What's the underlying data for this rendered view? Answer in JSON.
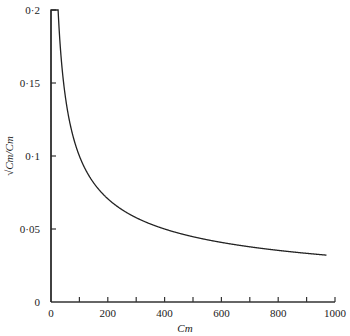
{
  "chart_data": {
    "type": "line",
    "title": "",
    "xlabel": "Cm",
    "ylabel": "√Cm/Cm",
    "xlim": [
      0,
      1000
    ],
    "ylim": [
      0,
      0.2
    ],
    "x_ticks": [
      0,
      100,
      200,
      300,
      400,
      500,
      600,
      700,
      800,
      900,
      1000
    ],
    "x_tick_labels": [
      {
        "value": 0,
        "label": "0"
      },
      {
        "value": 200,
        "label": "200"
      },
      {
        "value": 400,
        "label": "400"
      },
      {
        "value": 600,
        "label": "600"
      },
      {
        "value": 800,
        "label": "800"
      },
      {
        "value": 1000,
        "label": "1000"
      }
    ],
    "y_tick_labels": [
      {
        "value": 0,
        "label": "0"
      },
      {
        "value": 0.05,
        "label": "0·05"
      },
      {
        "value": 0.1,
        "label": "0·1"
      },
      {
        "value": 0.15,
        "label": "0·15"
      },
      {
        "value": 0.2,
        "label": "0·2"
      }
    ],
    "grid": false,
    "legend": "none",
    "series": [
      {
        "name": "√Cm/Cm",
        "description": "y = 1/sqrt(Cm), capped at 0.2 for Cm < 25",
        "x": [
          0,
          25,
          30,
          40,
          50,
          60,
          75,
          100,
          125,
          150,
          200,
          250,
          300,
          350,
          400,
          500,
          600,
          700,
          800,
          900,
          970
        ],
        "y": [
          0.2,
          0.2,
          0.1826,
          0.1581,
          0.1414,
          0.1291,
          0.1155,
          0.1,
          0.0894,
          0.0816,
          0.0707,
          0.0632,
          0.0577,
          0.0535,
          0.05,
          0.0447,
          0.0408,
          0.0378,
          0.0354,
          0.0333,
          0.0321
        ]
      }
    ]
  }
}
